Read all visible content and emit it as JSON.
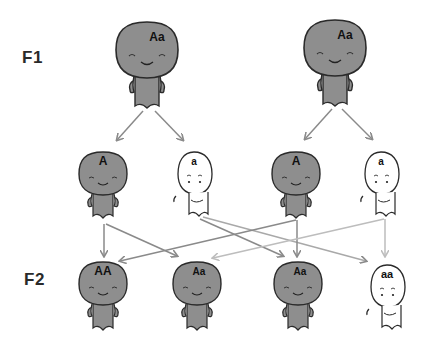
{
  "generations": {
    "f1_label": "F1",
    "f2_label": "F2"
  },
  "colors": {
    "dominant_fill": "#8e8e8e",
    "recessive_fill": "#ffffff",
    "outline": "#2a2a2a",
    "arrow_dark": "#8a8a8a",
    "arrow_light": "#bdbdbd"
  },
  "f1_parents": [
    {
      "genotype": "Aa",
      "phenotype": "dominant"
    },
    {
      "genotype": "Aa",
      "phenotype": "dominant"
    }
  ],
  "gametes": [
    {
      "allele": "A",
      "phenotype": "dominant"
    },
    {
      "allele": "a",
      "phenotype": "recessive"
    },
    {
      "allele": "A",
      "phenotype": "dominant"
    },
    {
      "allele": "a",
      "phenotype": "recessive"
    }
  ],
  "f2_offspring": [
    {
      "genotype": "AA",
      "phenotype": "dominant"
    },
    {
      "genotype": "Aa",
      "phenotype": "dominant"
    },
    {
      "genotype": "Aa",
      "phenotype": "dominant"
    },
    {
      "genotype": "aa",
      "phenotype": "recessive"
    }
  ]
}
